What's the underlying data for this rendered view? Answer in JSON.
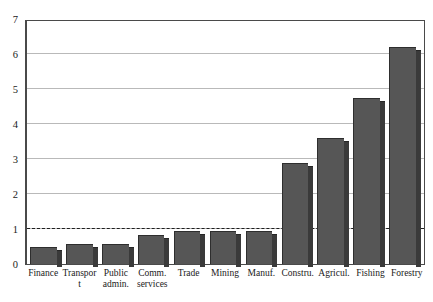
{
  "chart_data": {
    "type": "bar",
    "title": "",
    "subtitle": "",
    "xlabel": "",
    "ylabel": "",
    "categories": [
      "Finance",
      "Transport",
      "Public admin.",
      "Comm. services",
      "Trade",
      "Mining",
      "Manuf.",
      "Constru.",
      "Agricul.",
      "Fishing",
      "Forestry"
    ],
    "category_lines": [
      [
        "Finance",
        ""
      ],
      [
        "Transport",
        ""
      ],
      [
        "Public",
        "admin."
      ],
      [
        "Comm.",
        "services"
      ],
      [
        "Trade",
        ""
      ],
      [
        "Mining",
        ""
      ],
      [
        "Manuf.",
        ""
      ],
      [
        "Constru.",
        ""
      ],
      [
        "Agricul.",
        ""
      ],
      [
        "Fishing",
        ""
      ],
      [
        "Forestry",
        ""
      ]
    ],
    "values": [
      0.5,
      0.57,
      0.57,
      0.83,
      0.95,
      0.93,
      0.93,
      2.9,
      3.6,
      4.75,
      6.2
    ],
    "ylim": [
      0,
      7
    ],
    "y_ticks": [
      0,
      1,
      2,
      3,
      4,
      5,
      6,
      7
    ],
    "y_tick_labels": [
      "0",
      "1",
      "2",
      "3",
      "4",
      "5",
      "6",
      "7"
    ],
    "grid": true,
    "gridlines_at": [
      1,
      2,
      3,
      4,
      5,
      6
    ],
    "reference_line": {
      "value": 1,
      "style": "dashed",
      "color": "#1e1e1e"
    },
    "legend": null,
    "legend_position": "none",
    "annotations": [],
    "colors": {
      "bar_face": "#565656",
      "bar_side": "#3a3a3a",
      "bar_outline": "#2e2e2e",
      "gridline": "#b9b9b9",
      "axis": "#4a4a4a",
      "text": "#1a1a1a",
      "background": "#ffffff"
    }
  }
}
